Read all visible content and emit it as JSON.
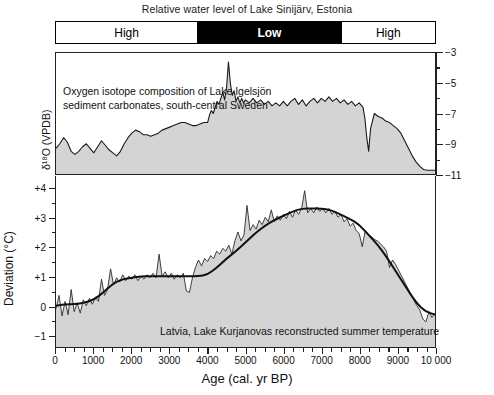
{
  "figure": {
    "title": "Relative water level of Lake Sinijärv, Estonia",
    "water_level_bar": [
      {
        "label": "High",
        "state": "high",
        "start_px": 0,
        "width_px": 142
      },
      {
        "label": "Low",
        "state": "low",
        "start_px": 142,
        "width_px": 145
      },
      {
        "label": "High",
        "state": "high",
        "start_px": 287,
        "width_px": 94
      }
    ],
    "iso_caption_line1": "Oxygen isotope composition of Lake Igelsjön",
    "iso_caption_line2": "sediment carbonates, south-central Sweden",
    "temp_caption": "Latvia, Lake Kurjanovas reconstructed summer temperature",
    "iso_axis_title": "δ¹⁸O (VPDB)",
    "temp_axis_title": "Deviation (°C)",
    "xaxis_title": "Age (cal. yr BP)",
    "iso_tick_labels": [
      "−3",
      "−5",
      "−7",
      "−9",
      "−11"
    ],
    "temp_tick_labels": [
      "+4",
      "+3",
      "+2",
      "+1",
      "0",
      "−1"
    ],
    "x_tick_labels": [
      "0",
      "1000",
      "2000",
      "3000",
      "4000",
      "5000",
      "6000",
      "7000",
      "8000",
      "9000",
      "10 000"
    ],
    "colors": {
      "fill": "#d4d4d4",
      "line": "#1a1a1a",
      "axis": "#222222",
      "low_bar": "#000000",
      "high_bar": "#ffffff"
    }
  },
  "chart_data": [
    {
      "type": "area",
      "id": "oxygen-isotope",
      "title": "Oxygen isotope composition of Lake Igelsjön sediment carbonates, south-central Sweden",
      "xlabel": "Age (cal. yr BP)",
      "ylabel": "δ¹⁸O (VPDB)",
      "xlim": [
        0,
        10000
      ],
      "ylim": [
        -11,
        -3
      ],
      "yticks": [
        -3,
        -5,
        -7,
        -9,
        -11
      ],
      "grid": false,
      "legend": null,
      "x": [
        0,
        100,
        200,
        300,
        400,
        500,
        600,
        700,
        800,
        900,
        1000,
        1100,
        1200,
        1300,
        1400,
        1500,
        1600,
        1700,
        1800,
        1900,
        2000,
        2100,
        2200,
        2300,
        2400,
        2500,
        2600,
        2700,
        2800,
        2900,
        3000,
        3100,
        3200,
        3300,
        3400,
        3500,
        3600,
        3700,
        3800,
        3900,
        4000,
        4050,
        4100,
        4150,
        4200,
        4250,
        4300,
        4350,
        4400,
        4450,
        4500,
        4550,
        4600,
        4650,
        4700,
        4750,
        4800,
        4850,
        4900,
        4950,
        5000,
        5100,
        5200,
        5300,
        5400,
        5500,
        5600,
        5700,
        5800,
        5900,
        6000,
        6100,
        6200,
        6300,
        6400,
        6500,
        6600,
        6700,
        6800,
        6900,
        7000,
        7100,
        7200,
        7300,
        7400,
        7500,
        7600,
        7700,
        7800,
        7900,
        8000,
        8100,
        8150,
        8200,
        8250,
        8300,
        8400,
        8500,
        8600,
        8700,
        8800,
        8900,
        9000,
        9100,
        9200,
        9300,
        9400,
        9500,
        9600,
        9700,
        9800,
        9900,
        10000
      ],
      "y": [
        -9.3,
        -9.0,
        -8.6,
        -8.9,
        -9.5,
        -9.7,
        -9.5,
        -9.2,
        -9.0,
        -9.3,
        -9.6,
        -9.2,
        -8.8,
        -9.1,
        -9.4,
        -9.6,
        -9.8,
        -9.5,
        -9.0,
        -8.6,
        -8.3,
        -8.1,
        -8.2,
        -8.4,
        -8.4,
        -8.5,
        -8.4,
        -8.3,
        -8.1,
        -8.0,
        -7.9,
        -7.8,
        -7.7,
        -7.6,
        -7.6,
        -7.7,
        -7.8,
        -7.8,
        -7.7,
        -7.6,
        -7.6,
        -7.1,
        -6.8,
        -7.0,
        -6.6,
        -6.2,
        -6.4,
        -6.0,
        -5.6,
        -6.1,
        -5.3,
        -3.6,
        -5.0,
        -5.8,
        -5.5,
        -6.2,
        -5.9,
        -6.3,
        -6.0,
        -6.3,
        -6.1,
        -6.3,
        -6.0,
        -6.3,
        -6.1,
        -6.4,
        -6.2,
        -6.5,
        -6.3,
        -6.5,
        -6.2,
        -6.5,
        -6.2,
        -6.0,
        -6.4,
        -6.1,
        -6.5,
        -6.2,
        -6.0,
        -6.3,
        -6.0,
        -6.2,
        -5.9,
        -6.2,
        -6.0,
        -6.3,
        -6.1,
        -6.4,
        -6.2,
        -6.5,
        -6.3,
        -6.6,
        -7.3,
        -8.6,
        -9.5,
        -8.0,
        -7.0,
        -7.2,
        -7.3,
        -7.5,
        -7.6,
        -7.8,
        -8.0,
        -8.3,
        -8.8,
        -9.3,
        -9.8,
        -10.2,
        -10.5,
        -10.7,
        -10.75,
        -10.75,
        -10.75,
        -10.75
      ]
    },
    {
      "type": "area",
      "id": "summer-temperature",
      "title": "Latvia, Lake Kurjanovas reconstructed summer temperature",
      "xlabel": "Age (cal. yr BP)",
      "ylabel": "Deviation (°C)",
      "xlim": [
        0,
        10000
      ],
      "ylim": [
        -1.4,
        4.4
      ],
      "yticks": [
        4,
        3,
        2,
        1,
        0,
        -1
      ],
      "grid": false,
      "series": [
        {
          "name": "raw proxy record",
          "x": [
            0,
            80,
            160,
            240,
            320,
            400,
            480,
            560,
            640,
            720,
            800,
            880,
            960,
            1040,
            1120,
            1200,
            1280,
            1360,
            1440,
            1520,
            1600,
            1680,
            1760,
            1840,
            1920,
            2000,
            2080,
            2160,
            2240,
            2320,
            2400,
            2480,
            2560,
            2640,
            2720,
            2800,
            2880,
            2960,
            3040,
            3120,
            3200,
            3280,
            3360,
            3440,
            3520,
            3600,
            3680,
            3760,
            3840,
            3920,
            4000,
            4080,
            4160,
            4240,
            4320,
            4400,
            4480,
            4560,
            4640,
            4720,
            4800,
            4880,
            4960,
            5040,
            5120,
            5200,
            5280,
            5360,
            5440,
            5520,
            5600,
            5680,
            5760,
            5840,
            5920,
            6000,
            6080,
            6160,
            6240,
            6320,
            6400,
            6480,
            6560,
            6640,
            6720,
            6800,
            6880,
            6960,
            7040,
            7120,
            7200,
            7280,
            7360,
            7440,
            7520,
            7600,
            7680,
            7760,
            7840,
            7920,
            8000,
            8080,
            8160,
            8240,
            8320,
            8400,
            8480,
            8560,
            8640,
            8720,
            8800,
            8880,
            8960,
            9040,
            9120,
            9200,
            9280,
            9360,
            9440,
            9520,
            9600,
            9680,
            9760,
            9840,
            9920,
            10000
          ],
          "y": [
            -0.1,
            0.35,
            -0.35,
            0.15,
            -0.3,
            0.55,
            -0.2,
            0.1,
            -0.25,
            0.2,
            0.0,
            0.25,
            0.05,
            0.3,
            0.15,
            0.9,
            0.35,
            0.55,
            1.25,
            0.7,
            0.95,
            0.8,
            1.05,
            0.85,
            1.0,
            0.9,
            1.05,
            0.85,
            1.0,
            0.9,
            1.05,
            0.95,
            1.1,
            0.95,
            1.75,
            1.0,
            1.15,
            0.95,
            1.1,
            0.9,
            1.05,
            0.95,
            1.1,
            0.5,
            0.45,
            0.95,
            1.3,
            1.55,
            1.35,
            1.6,
            1.5,
            1.7,
            1.6,
            1.85,
            1.75,
            1.95,
            1.85,
            2.05,
            1.75,
            2.2,
            2.5,
            2.2,
            2.4,
            3.4,
            2.55,
            2.75,
            2.6,
            2.9,
            2.75,
            3.0,
            2.85,
            3.25,
            2.85,
            3.05,
            2.9,
            3.1,
            2.95,
            3.2,
            3.0,
            3.25,
            3.1,
            3.3,
            3.9,
            3.15,
            3.3,
            3.15,
            3.35,
            3.2,
            3.3,
            3.15,
            3.3,
            3.1,
            3.2,
            3.0,
            3.1,
            2.85,
            2.95,
            2.7,
            2.8,
            2.55,
            2.45,
            2.0,
            2.55,
            2.4,
            2.35,
            2.25,
            2.2,
            2.1,
            2.0,
            1.85,
            1.3,
            1.55,
            1.4,
            1.2,
            1.0,
            0.8,
            0.6,
            0.4,
            0.2,
            0.0,
            -0.15,
            -0.45,
            -0.55,
            -0.2,
            -0.4,
            -0.25,
            -0.3
          ]
        },
        {
          "name": "smoothed trend",
          "x": [
            0,
            250,
            500,
            750,
            1000,
            1250,
            1500,
            1750,
            2000,
            2250,
            2500,
            2750,
            3000,
            3250,
            3500,
            3750,
            4000,
            4250,
            4500,
            4750,
            5000,
            5250,
            5500,
            5750,
            6000,
            6250,
            6500,
            6750,
            7000,
            7250,
            7500,
            7750,
            8000,
            8250,
            8500,
            8750,
            9000,
            9250,
            9500,
            9750,
            10000
          ],
          "y": [
            0.0,
            0.05,
            0.05,
            0.1,
            0.2,
            0.45,
            0.75,
            0.9,
            0.95,
            1.0,
            1.0,
            1.0,
            1.0,
            1.0,
            1.0,
            1.0,
            1.05,
            1.3,
            1.6,
            1.85,
            2.15,
            2.45,
            2.7,
            2.9,
            3.05,
            3.2,
            3.3,
            3.3,
            3.3,
            3.25,
            3.1,
            2.95,
            2.75,
            2.4,
            2.05,
            1.6,
            1.1,
            0.6,
            0.1,
            -0.2,
            -0.3
          ]
        }
      ]
    }
  ]
}
